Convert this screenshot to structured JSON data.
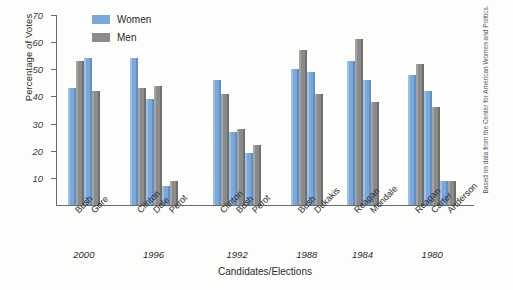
{
  "chart_data": {
    "type": "bar",
    "title": "",
    "xlabel": "Candidates/Elections",
    "ylabel": "Percentage of Votes",
    "ylim": [
      0,
      70
    ],
    "yticks": [
      10,
      20,
      30,
      40,
      50,
      60,
      70
    ],
    "grid": false,
    "legend_position": "top-left",
    "legend": [
      "Women",
      "Men"
    ],
    "source_note": "Based on data from the Center for American Women and Politics.",
    "categories": [
      "Bush",
      "Gore",
      "Clinton",
      "Dole",
      "Perot",
      "Clinton",
      "Bush",
      "Perot",
      "Bush",
      "Dukakis",
      "Reagan",
      "Mondale",
      "Reagan",
      "Carter",
      "Anderson"
    ],
    "series": [
      {
        "name": "Women",
        "color": "#7aa8dd",
        "values": [
          43,
          54,
          54,
          39,
          7,
          46,
          27,
          19,
          50,
          49,
          53,
          46,
          48,
          42,
          9
        ]
      },
      {
        "name": "Men",
        "color": "#8b8b89",
        "values": [
          53,
          42,
          43,
          44,
          9,
          41,
          28,
          22,
          57,
          41,
          61,
          38,
          52,
          36,
          9
        ]
      }
    ],
    "groups": [
      {
        "year": "2000",
        "candidates": [
          {
            "name": "Bush",
            "women": 43,
            "men": 53
          },
          {
            "name": "Gore",
            "women": 54,
            "men": 42
          }
        ]
      },
      {
        "year": "1996",
        "candidates": [
          {
            "name": "Clinton",
            "women": 54,
            "men": 43
          },
          {
            "name": "Dole",
            "women": 39,
            "men": 44
          },
          {
            "name": "Perot",
            "women": 7,
            "men": 9
          }
        ]
      },
      {
        "year": "1992",
        "candidates": [
          {
            "name": "Clinton",
            "women": 46,
            "men": 41
          },
          {
            "name": "Bush",
            "women": 27,
            "men": 28
          },
          {
            "name": "Perot",
            "women": 19,
            "men": 22
          }
        ]
      },
      {
        "year": "1988",
        "candidates": [
          {
            "name": "Bush",
            "women": 50,
            "men": 57
          },
          {
            "name": "Dukakis",
            "women": 49,
            "men": 41
          }
        ]
      },
      {
        "year": "1984",
        "candidates": [
          {
            "name": "Reagan",
            "women": 53,
            "men": 61
          },
          {
            "name": "Mondale",
            "women": 46,
            "men": 38
          }
        ]
      },
      {
        "year": "1980",
        "candidates": [
          {
            "name": "Reagan",
            "women": 48,
            "men": 52
          },
          {
            "name": "Carter",
            "women": 42,
            "men": 36
          },
          {
            "name": "Anderson",
            "women": 9,
            "men": 9
          }
        ]
      }
    ]
  }
}
